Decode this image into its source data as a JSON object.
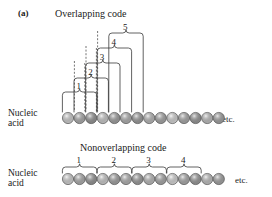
{
  "figure": {
    "panel_letter": "(a)",
    "etc_label_top": "etc.",
    "etc_label_bottom": "etc."
  },
  "overlapping": {
    "title": "Overlapping code",
    "nucleic_label_line1": "Nucleic",
    "nucleic_label_line2": "acid",
    "codon_numbers": [
      "1",
      "2",
      "3",
      "4",
      "5"
    ],
    "circle_count": 14,
    "circle_shades": [
      "#d9d9d9",
      "#b3b3b3",
      "#999999",
      "#d4d4d4",
      "#a6a6a6",
      "#b8b8b8",
      "#a0a0a0",
      "#c2c2c2",
      "#adadad",
      "#e0e0e0",
      "#b0b0b0",
      "#9c9c9c",
      "#c8c8c8",
      "#a8a8a8"
    ]
  },
  "nonoverlapping": {
    "title": "Nonoverlapping code",
    "nucleic_label_line1": "Nucleic",
    "nucleic_label_line2": "acid",
    "codon_numbers": [
      "1",
      "2",
      "3",
      "4"
    ],
    "circle_count": 14,
    "circle_shades": [
      "#dcdcdc",
      "#b5b5b5",
      "#9a9a9a",
      "#d6d6d6",
      "#a8a8a8",
      "#bababa",
      "#a2a2a2",
      "#c4c4c4",
      "#afafaf",
      "#e2e2e2",
      "#b2b2b2",
      "#9e9e9e",
      "#cacaca",
      "#aaaaaa"
    ]
  },
  "style": {
    "stroke_color": "#3a3a3a",
    "circle_outline": "#555555",
    "background": "#ffffff"
  }
}
